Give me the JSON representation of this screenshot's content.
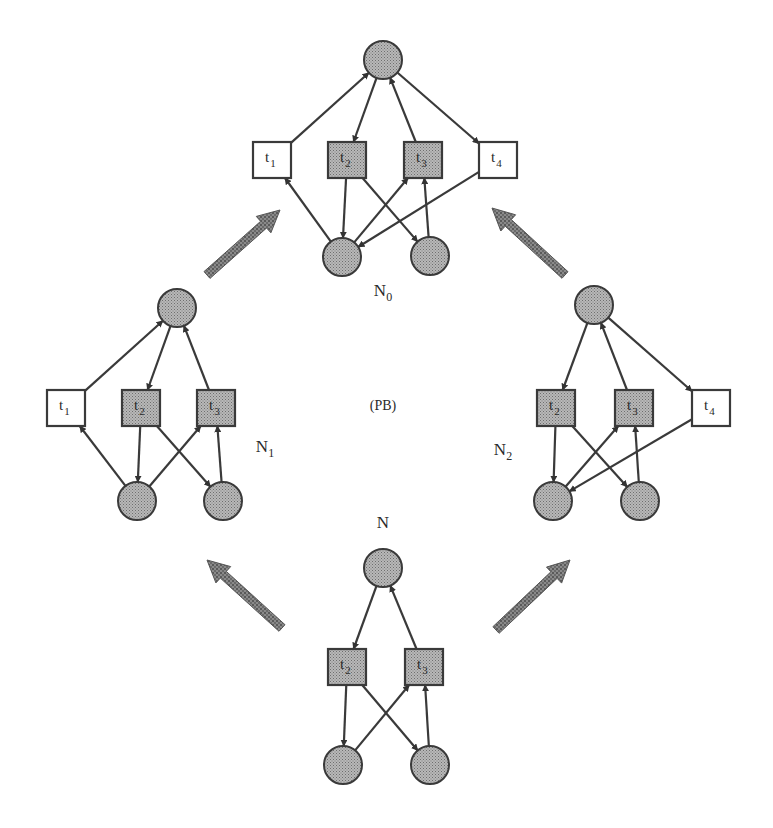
{
  "colors": {
    "background": "#ffffff",
    "place_fill": "#a8a8a8",
    "shaded_transition_fill": "#a8a8a8",
    "plain_transition_fill": "#ffffff",
    "stroke": "#3a3a3a",
    "big_arrow": "#7a7a7a"
  },
  "center_label": "(PB)",
  "networks": [
    {
      "id": "N0",
      "label_main": "N",
      "label_sub": "0",
      "label_pos": [
        383,
        296
      ],
      "places": [
        {
          "id": "p_top",
          "x": 383,
          "y": 60
        },
        {
          "id": "p_bl",
          "x": 342,
          "y": 257
        },
        {
          "id": "p_br",
          "x": 430,
          "y": 256
        }
      ],
      "transitions": [
        {
          "id": "t1",
          "name": "t",
          "sub": "1",
          "x": 272,
          "y": 160,
          "shaded": false
        },
        {
          "id": "t2",
          "name": "t",
          "sub": "2",
          "x": 347,
          "y": 160,
          "shaded": true
        },
        {
          "id": "t3",
          "name": "t",
          "sub": "3",
          "x": 423,
          "y": 160,
          "shaded": true
        },
        {
          "id": "t4",
          "name": "t",
          "sub": "4",
          "x": 498,
          "y": 160,
          "shaded": false
        }
      ],
      "arcs": [
        [
          "t1",
          "p_top"
        ],
        [
          "p_top",
          "t2"
        ],
        [
          "t3",
          "p_top"
        ],
        [
          "p_top",
          "t4"
        ],
        [
          "p_bl",
          "t1"
        ],
        [
          "t2",
          "p_bl"
        ],
        [
          "p_bl",
          "t3"
        ],
        [
          "t2",
          "p_br"
        ],
        [
          "p_br",
          "t3"
        ],
        [
          "t4",
          "p_bl"
        ]
      ]
    },
    {
      "id": "N1",
      "label_main": "N",
      "label_sub": "1",
      "label_pos": [
        265,
        452
      ],
      "places": [
        {
          "id": "p_top",
          "x": 177,
          "y": 308
        },
        {
          "id": "p_bl",
          "x": 137,
          "y": 501
        },
        {
          "id": "p_br",
          "x": 223,
          "y": 501
        }
      ],
      "transitions": [
        {
          "id": "t1",
          "name": "t",
          "sub": "1",
          "x": 66,
          "y": 408,
          "shaded": false
        },
        {
          "id": "t2",
          "name": "t",
          "sub": "2",
          "x": 141,
          "y": 408,
          "shaded": true
        },
        {
          "id": "t3",
          "name": "t",
          "sub": "3",
          "x": 216,
          "y": 408,
          "shaded": true
        }
      ],
      "arcs": [
        [
          "t1",
          "p_top"
        ],
        [
          "p_top",
          "t2"
        ],
        [
          "t3",
          "p_top"
        ],
        [
          "p_bl",
          "t1"
        ],
        [
          "t2",
          "p_bl"
        ],
        [
          "p_bl",
          "t3"
        ],
        [
          "t2",
          "p_br"
        ],
        [
          "p_br",
          "t3"
        ]
      ]
    },
    {
      "id": "N2",
      "label_main": "N",
      "label_sub": "2",
      "label_pos": [
        503,
        455
      ],
      "places": [
        {
          "id": "p_top",
          "x": 594,
          "y": 305
        },
        {
          "id": "p_bl",
          "x": 553,
          "y": 501
        },
        {
          "id": "p_br",
          "x": 640,
          "y": 501
        }
      ],
      "transitions": [
        {
          "id": "t2",
          "name": "t",
          "sub": "2",
          "x": 556,
          "y": 408,
          "shaded": true
        },
        {
          "id": "t3",
          "name": "t",
          "sub": "3",
          "x": 634,
          "y": 408,
          "shaded": true
        },
        {
          "id": "t4",
          "name": "t",
          "sub": "4",
          "x": 711,
          "y": 408,
          "shaded": false
        }
      ],
      "arcs": [
        [
          "p_top",
          "t2"
        ],
        [
          "t3",
          "p_top"
        ],
        [
          "p_top",
          "t4"
        ],
        [
          "t2",
          "p_bl"
        ],
        [
          "p_bl",
          "t3"
        ],
        [
          "t2",
          "p_br"
        ],
        [
          "p_br",
          "t3"
        ],
        [
          "t4",
          "p_bl"
        ]
      ]
    },
    {
      "id": "N",
      "label_main": "N",
      "label_sub": "",
      "label_pos": [
        383,
        528
      ],
      "places": [
        {
          "id": "p_top",
          "x": 383,
          "y": 568
        },
        {
          "id": "p_bl",
          "x": 343,
          "y": 765
        },
        {
          "id": "p_br",
          "x": 430,
          "y": 765
        }
      ],
      "transitions": [
        {
          "id": "t2",
          "name": "t",
          "sub": "2",
          "x": 347,
          "y": 667,
          "shaded": true
        },
        {
          "id": "t3",
          "name": "t",
          "sub": "3",
          "x": 424,
          "y": 667,
          "shaded": true
        }
      ],
      "arcs": [
        [
          "p_top",
          "t2"
        ],
        [
          "t3",
          "p_top"
        ],
        [
          "t2",
          "p_bl"
        ],
        [
          "p_bl",
          "t3"
        ],
        [
          "t2",
          "p_br"
        ],
        [
          "p_br",
          "t3"
        ]
      ]
    }
  ],
  "big_arrows": [
    {
      "id": "N-to-N1",
      "from": [
        282,
        628
      ],
      "to": [
        207,
        560
      ]
    },
    {
      "id": "N-to-N2",
      "from": [
        496,
        630
      ],
      "to": [
        570,
        560
      ]
    },
    {
      "id": "N1-to-N0",
      "from": [
        207,
        275
      ],
      "to": [
        280,
        210
      ]
    },
    {
      "id": "N2-to-N0",
      "from": [
        565,
        275
      ],
      "to": [
        492,
        208
      ]
    }
  ]
}
